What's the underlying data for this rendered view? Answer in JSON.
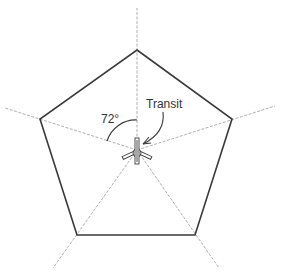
{
  "diagram": {
    "labels": {
      "angle": "72°",
      "instrument": "Transit"
    },
    "shape": {
      "type": "regular-pentagon",
      "sides": 5,
      "central_angle_deg": 72
    },
    "colors": {
      "outline": "#3a3a3a",
      "rays": "#9a9a9a",
      "text": "#333333"
    }
  }
}
